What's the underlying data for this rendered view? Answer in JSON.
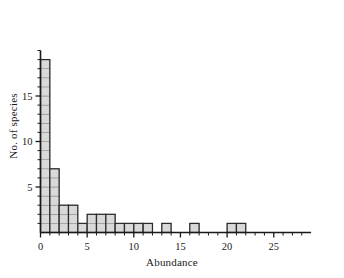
{
  "chart_data": {
    "type": "bar",
    "title": "",
    "subtitle": "",
    "xlabel": "Abundance",
    "ylabel": "No. of species",
    "xlim": [
      0,
      29
    ],
    "ylim": [
      0,
      20
    ],
    "xticks": [
      0,
      5,
      10,
      15,
      20,
      25
    ],
    "yticks": [
      5,
      10,
      15
    ],
    "xminorticks": [
      1,
      2,
      3,
      4,
      6,
      7,
      8,
      9,
      11,
      12,
      13,
      14,
      16,
      17,
      18,
      19,
      21,
      22,
      23,
      24,
      26,
      27,
      28
    ],
    "yminorticks": [
      1,
      2,
      3,
      4,
      6,
      7,
      8,
      9,
      11,
      12,
      13,
      14,
      16,
      17,
      18,
      19,
      20
    ],
    "grid": false,
    "legend": null,
    "bin_width": 1,
    "bin_starts": [
      0,
      1,
      2,
      3,
      4,
      5,
      6,
      7,
      8,
      9,
      10,
      11,
      12,
      13,
      14,
      15,
      16,
      17,
      18,
      19,
      20,
      21,
      22,
      23,
      24,
      25,
      26,
      27,
      28
    ],
    "categories": [
      "0-1",
      "1-2",
      "2-3",
      "3-4",
      "4-5",
      "5-6",
      "6-7",
      "7-8",
      "8-9",
      "9-10",
      "10-11",
      "11-12",
      "12-13",
      "13-14",
      "14-15",
      "15-16",
      "16-17",
      "17-18",
      "18-19",
      "19-20",
      "20-21",
      "21-22",
      "22-23",
      "23-24",
      "24-25",
      "25-26",
      "26-27",
      "27-28",
      "28-29"
    ],
    "values": [
      19,
      7,
      3,
      3,
      1,
      2,
      2,
      2,
      1,
      1,
      1,
      1,
      0,
      1,
      0,
      0,
      1,
      0,
      0,
      0,
      1,
      1,
      0,
      0,
      0,
      0,
      0,
      0,
      0
    ],
    "bar_fill": "#d9d9d9",
    "bar_stroke": "#2b2b2b",
    "bar_grid_stroke": "#8c8c8c",
    "axis_color": "#1a1a1a",
    "background": "#ffffff"
  },
  "axes": {
    "x_title": "Abundance",
    "y_title": "No. of species"
  },
  "tick_text": {
    "x": [
      "0",
      "5",
      "10",
      "15",
      "20",
      "25"
    ],
    "y": [
      "5",
      "10",
      "15"
    ]
  }
}
